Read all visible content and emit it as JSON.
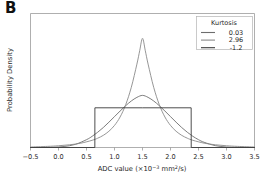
{
  "panel": {
    "label": "B"
  },
  "chart_data": {
    "type": "line",
    "title": "",
    "subtitle": "",
    "xlabel": "ADC value (×10⁻³ mm²/s)",
    "ylabel": "Probability Density",
    "xlim": [
      -0.5,
      3.5
    ],
    "ylim": [
      0,
      1.08
    ],
    "grid": false,
    "xticks": [
      -0.5,
      0.0,
      0.5,
      1.0,
      1.5,
      2.0,
      2.5,
      3.0,
      3.5
    ],
    "xticklabels": [
      "−0.5",
      "0.0",
      "0.5",
      "1.0",
      "1.5",
      "2.0",
      "2.5",
      "3.0",
      "3.5"
    ],
    "yticks": [],
    "yticklabels": [],
    "legend": {
      "title": "Kurtosis",
      "position": "upper right",
      "entries": [
        {
          "label": "0.03",
          "color": "#6d6d6d",
          "kurtosis": 0.03,
          "shape": "gaussian",
          "mean": 1.5,
          "sigma": 0.5,
          "peak": 0.56
        },
        {
          "label": "2.96",
          "color": "#8a8a8a",
          "kurtosis": 2.96,
          "shape": "leptokurtic",
          "mean": 1.5,
          "sigma": 0.34,
          "peak": 1.0
        },
        {
          "label": "-1.2",
          "color": "#3a3a3a",
          "kurtosis": -1.2,
          "shape": "uniform",
          "low": 0.65,
          "high": 2.37,
          "peak": 0.42
        }
      ]
    },
    "series": [
      {
        "name": "0.03",
        "color": "#6d6d6d",
        "x": [
          -0.5,
          -0.3,
          -0.1,
          0.1,
          0.3,
          0.5,
          0.6,
          0.7,
          0.8,
          0.9,
          1.0,
          1.1,
          1.2,
          1.3,
          1.4,
          1.5,
          1.6,
          1.7,
          1.8,
          1.9,
          2.0,
          2.1,
          2.2,
          2.3,
          2.4,
          2.5,
          2.6,
          2.8,
          3.0,
          3.2,
          3.5
        ],
        "y": [
          0.0,
          0.0,
          0.002,
          0.008,
          0.025,
          0.063,
          0.09,
          0.123,
          0.161,
          0.204,
          0.249,
          0.294,
          0.337,
          0.375,
          0.404,
          0.42,
          0.404,
          0.375,
          0.337,
          0.294,
          0.249,
          0.204,
          0.161,
          0.123,
          0.09,
          0.063,
          0.042,
          0.015,
          0.004,
          0.001,
          0.0
        ]
      },
      {
        "name": "2.96",
        "color": "#8a8a8a",
        "x": [
          -0.5,
          -0.2,
          0.0,
          0.2,
          0.4,
          0.6,
          0.7,
          0.8,
          0.9,
          1.0,
          1.1,
          1.2,
          1.3,
          1.4,
          1.45,
          1.5,
          1.55,
          1.6,
          1.7,
          1.8,
          1.9,
          2.0,
          2.1,
          2.2,
          2.3,
          2.4,
          2.6,
          2.8,
          3.0,
          3.2,
          3.5
        ],
        "y": [
          0.004,
          0.009,
          0.014,
          0.022,
          0.035,
          0.058,
          0.075,
          0.098,
          0.131,
          0.178,
          0.246,
          0.345,
          0.485,
          0.672,
          0.78,
          0.88,
          0.78,
          0.672,
          0.485,
          0.345,
          0.246,
          0.178,
          0.131,
          0.098,
          0.075,
          0.058,
          0.035,
          0.022,
          0.014,
          0.009,
          0.004
        ]
      },
      {
        "name": "-1.2",
        "color": "#3a3a3a",
        "x": [
          -0.5,
          0.649,
          0.65,
          1.5,
          2.369,
          2.37,
          3.5
        ],
        "y": [
          0.0,
          0.0,
          0.32,
          0.32,
          0.32,
          0.0,
          0.0
        ]
      }
    ]
  }
}
